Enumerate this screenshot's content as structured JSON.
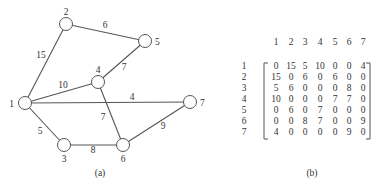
{
  "graph": {
    "caption": "(a)",
    "nodes": [
      {
        "id": "1",
        "label": "1"
      },
      {
        "id": "2",
        "label": "2"
      },
      {
        "id": "3",
        "label": "3"
      },
      {
        "id": "4",
        "label": "4"
      },
      {
        "id": "5",
        "label": "5"
      },
      {
        "id": "6",
        "label": "6"
      },
      {
        "id": "7",
        "label": "7"
      }
    ],
    "edges": [
      {
        "from": "1",
        "to": "2",
        "weight": "15"
      },
      {
        "from": "2",
        "to": "5",
        "weight": "6"
      },
      {
        "from": "1",
        "to": "4",
        "weight": "10"
      },
      {
        "from": "4",
        "to": "5",
        "weight": "7"
      },
      {
        "from": "1",
        "to": "7",
        "weight": "4"
      },
      {
        "from": "4",
        "to": "6",
        "weight": "7"
      },
      {
        "from": "1",
        "to": "3",
        "weight": "5"
      },
      {
        "from": "3",
        "to": "6",
        "weight": "8"
      },
      {
        "from": "6",
        "to": "7",
        "weight": "9"
      }
    ]
  },
  "matrix": {
    "caption": "(b)",
    "col_headers": [
      "1",
      "2",
      "3",
      "4",
      "5",
      "6",
      "7"
    ],
    "row_headers": [
      "1",
      "2",
      "3",
      "4",
      "5",
      "6",
      "7"
    ],
    "rows": [
      [
        "0",
        "15",
        "5",
        "10",
        "0",
        "0",
        "4"
      ],
      [
        "15",
        "0",
        "6",
        "0",
        "6",
        "0",
        "0"
      ],
      [
        "5",
        "6",
        "0",
        "0",
        "0",
        "8",
        "0"
      ],
      [
        "10",
        "0",
        "0",
        "0",
        "7",
        "7",
        "0"
      ],
      [
        "0",
        "6",
        "0",
        "7",
        "0",
        "0",
        "0"
      ],
      [
        "0",
        "0",
        "8",
        "7",
        "0",
        "0",
        "9"
      ],
      [
        "4",
        "0",
        "0",
        "0",
        "0",
        "9",
        "0"
      ]
    ]
  }
}
